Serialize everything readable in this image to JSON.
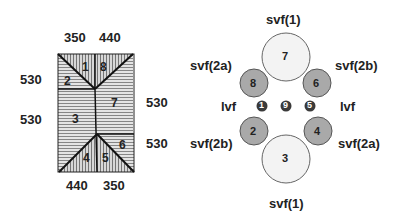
{
  "left_diagram": {
    "top_labels": [
      "350",
      "440"
    ],
    "bottom_labels": [
      "440",
      "350"
    ],
    "left_labels": [
      "530",
      "530"
    ],
    "right_labels": [
      "530",
      "530"
    ],
    "regions": [
      "1",
      "2",
      "3",
      "4",
      "5",
      "6",
      "7",
      "8"
    ]
  },
  "right_diagram": {
    "circles": [
      {
        "id": "7",
        "label": "svf(1)",
        "size": "large",
        "position": "top"
      },
      {
        "id": "8",
        "label": "svf(2a)",
        "size": "medium",
        "position": "upper-left"
      },
      {
        "id": "6",
        "label": "svf(2b)",
        "size": "medium",
        "position": "upper-right"
      },
      {
        "id": "1",
        "label": "lvf",
        "size": "small",
        "position": "middle-left"
      },
      {
        "id": "9",
        "label": "",
        "size": "small",
        "position": "middle-center"
      },
      {
        "id": "5",
        "label": "lvf",
        "size": "small",
        "position": "middle-right"
      },
      {
        "id": "2",
        "label": "svf(2b)",
        "size": "medium",
        "position": "lower-left"
      },
      {
        "id": "4",
        "label": "svf(2a)",
        "size": "medium",
        "position": "lower-right"
      },
      {
        "id": "3",
        "label": "svf(1)",
        "size": "large",
        "position": "bottom"
      }
    ],
    "labels": {
      "top": "svf(1)",
      "upper_left": "svf(2a)",
      "upper_right": "svf(2b)",
      "mid_left": "lvf",
      "mid_right": "lvf",
      "lower_left": "svf(2b)",
      "lower_right": "svf(2a)",
      "bottom": "svf(1)"
    }
  },
  "colors": {
    "large_fill": "#f2f2f2",
    "medium_fill": "#a8a8a8",
    "small_fill": "#3a3a3a",
    "line": "#111111"
  }
}
